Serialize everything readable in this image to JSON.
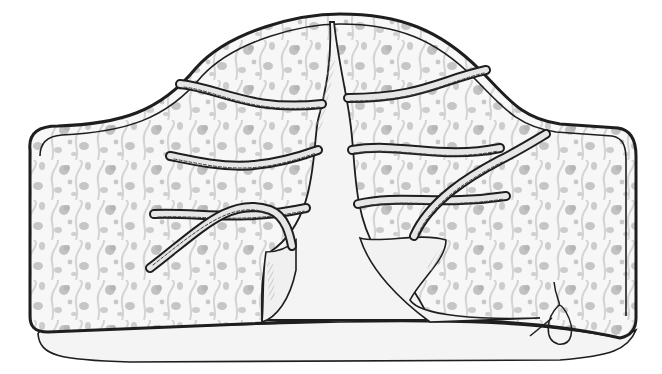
{
  "illustration": {
    "subject": "fabric cover with tie strips",
    "style": "pen-and-ink sketch",
    "caption": "",
    "colors": {
      "ink": "#1e1e1e",
      "paper": "#ffffff",
      "fabric_pattern": "#bdbdbd",
      "fabric_pattern_dark": "#9a9a9a",
      "inner_lining": "#f4f4f4",
      "tie_fill": "#e6e6e6",
      "shading": "#8c8c8c"
    },
    "parts": [
      {
        "name": "patterned-outer-panel",
        "description": "floral-patterned fabric body with rounded dome top and rounded square sides"
      },
      {
        "name": "center-slit",
        "description": "narrow plain lining wedge rising from bottom center to the top"
      },
      {
        "name": "folded-corner-left",
        "description": "lining corner turned back at lower left of slit"
      },
      {
        "name": "folded-corner-right",
        "description": "lining corner turned back at lower right of slit"
      },
      {
        "name": "bottom-hem",
        "description": "curved plain lining visible along bottom edge"
      },
      {
        "name": "thread-loop",
        "description": "small loop of thread stitched at lower right hem"
      }
    ],
    "ties": [
      {
        "id": "tie-1",
        "side": "left",
        "row": 1
      },
      {
        "id": "tie-2",
        "side": "left",
        "row": 2
      },
      {
        "id": "tie-3",
        "side": "left",
        "row": 3
      },
      {
        "id": "tie-4",
        "side": "left",
        "row": 3,
        "note": "crossing tie"
      },
      {
        "id": "tie-5",
        "side": "right",
        "row": 1
      },
      {
        "id": "tie-6",
        "side": "right",
        "row": 2
      },
      {
        "id": "tie-7",
        "side": "right",
        "row": 3
      },
      {
        "id": "tie-8",
        "side": "right",
        "row": 3,
        "note": "crossing tie"
      }
    ]
  }
}
